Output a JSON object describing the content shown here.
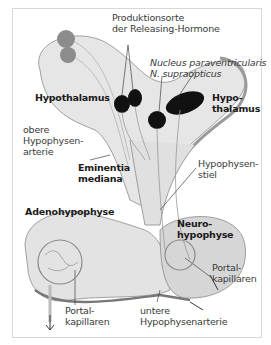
{
  "figure": {
    "labels": {
      "produktionsorte_1": "Produktionsorte",
      "produktionsorte_2": "der Releasing-Hormone",
      "nucleus_1": "Nucleus paraventricularis",
      "nucleus_2": "N. supraopticus",
      "hypothalamus_left": "Hypothalamus",
      "hypothalamus_right_1": "Hypo-",
      "hypothalamus_right_2": "thalamus",
      "obere_1": "obere",
      "obere_2": "Hypophysen-",
      "obere_3": "arterie",
      "eminentia_1": "Eminentia",
      "eminentia_2": "mediana",
      "stiel_1": "Hypophysen-",
      "stiel_2": "stiel",
      "adeno": "Adenohypophyse",
      "neuro_1": "Neuro-",
      "neuro_2": "hypophyse",
      "portal_right_1": "Portal-",
      "portal_right_2": "kapillaren",
      "portal_left_1": "Portal-",
      "portal_left_2": "kapillaren",
      "untere_1": "untere",
      "untere_2": "Hypophysenarterie"
    },
    "colors": {
      "tissue": "#e6e6e6",
      "tissue_dark": "#c9c9c9",
      "outline": "#8a8a8a",
      "neuron": "#111111",
      "neuron_gray": "#8c8c8c"
    }
  }
}
